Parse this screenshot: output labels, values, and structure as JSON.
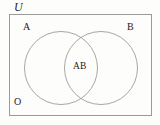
{
  "diagram": {
    "type": "venn-two-set",
    "title_label": "U",
    "background_color": "#fdfdfc",
    "stroke_color": "#8a8a8a",
    "text_color": "#1b1b1b",
    "universe": {
      "name": "universal-set",
      "label": "U",
      "rect": {
        "x": 9,
        "y": 14,
        "width": 143,
        "height": 102
      }
    },
    "sets": [
      {
        "name": "set-a",
        "label": "A",
        "circle": {
          "cx": 61,
          "cy": 68,
          "r": 36.5
        }
      },
      {
        "name": "set-b",
        "label": "B",
        "circle": {
          "cx": 101,
          "cy": 68,
          "r": 36.5
        }
      }
    ],
    "regions": [
      {
        "name": "intersection",
        "label": "AB"
      },
      {
        "name": "complement",
        "label": "O"
      }
    ]
  }
}
